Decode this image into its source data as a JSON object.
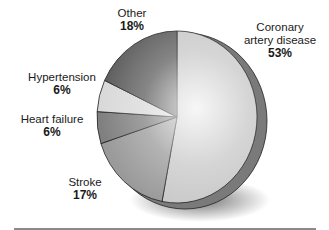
{
  "chart_data": {
    "type": "pie",
    "title": "",
    "style": "3d-shaded-grayscale",
    "start_angle_deg": 0,
    "direction": "clockwise",
    "slices": [
      {
        "label": "Coronary artery disease",
        "value": 53,
        "display": "53%",
        "color": "#c8c8c8"
      },
      {
        "label": "Stroke",
        "value": 17,
        "display": "17%",
        "color": "#9a9a9a"
      },
      {
        "label": "Heart failure",
        "value": 6,
        "display": "6%",
        "color": "#808080"
      },
      {
        "label": "Hypertension",
        "value": 6,
        "display": "6%",
        "color": "#d9d9d9"
      },
      {
        "label": "Other",
        "value": 18,
        "display": "18%",
        "color": "#5e5e5e"
      }
    ],
    "legend": "none",
    "units": "%"
  },
  "labels": {
    "cad_line1": "Coronary",
    "cad_line2": "artery disease",
    "cad_pct": "53%",
    "stroke": "Stroke",
    "stroke_pct": "17%",
    "heart_failure": "Heart failure",
    "heart_failure_pct": "6%",
    "hypertension": "Hypertension",
    "hypertension_pct": "6%",
    "other": "Other",
    "other_pct": "18%"
  }
}
